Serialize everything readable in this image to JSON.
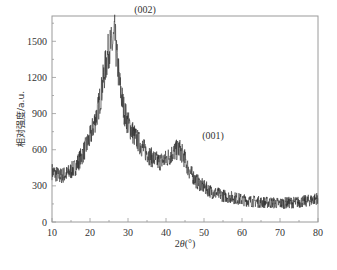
{
  "chart_data": {
    "type": "line",
    "title": "",
    "xlabel": "2θ(°)",
    "ylabel": "相对强度/a.u.",
    "xlim": [
      10,
      80
    ],
    "ylim": [
      0,
      1710
    ],
    "xticks": [
      10,
      20,
      30,
      40,
      50,
      60,
      70,
      80
    ],
    "yticks": [
      0,
      300,
      600,
      900,
      1200,
      1500
    ],
    "grid": false,
    "legend": null,
    "annotations": [
      {
        "text": "(002)",
        "x": 26.5,
        "y": 1600
      },
      {
        "text": "(001)",
        "x": 43.5,
        "y": 650
      }
    ],
    "series": [
      {
        "name": "XRD pattern",
        "color": "#2a2a2a",
        "noisy": true,
        "x": [
          10,
          12,
          14,
          16,
          18,
          20,
          22,
          23,
          24,
          25,
          26,
          26.5,
          27,
          28,
          29,
          30,
          32,
          34,
          36,
          38,
          40,
          42,
          43.5,
          45,
          46,
          48,
          50,
          52,
          55,
          58,
          60,
          62,
          65,
          68,
          70,
          72,
          75,
          78,
          80
        ],
        "values": [
          420,
          380,
          400,
          450,
          560,
          700,
          920,
          1080,
          1280,
          1440,
          1480,
          1550,
          1380,
          1100,
          920,
          820,
          700,
          610,
          540,
          500,
          520,
          580,
          610,
          520,
          430,
          340,
          290,
          250,
          220,
          200,
          185,
          175,
          165,
          160,
          155,
          160,
          165,
          180,
          200
        ]
      }
    ]
  },
  "axes": {
    "x_title_prefix": "2",
    "x_title_theta": "θ",
    "x_title_suffix": "(°)",
    "y_title": "相对强度/a.u."
  },
  "annotations": {
    "peak_002": "(002)",
    "peak_001": "(001)"
  }
}
